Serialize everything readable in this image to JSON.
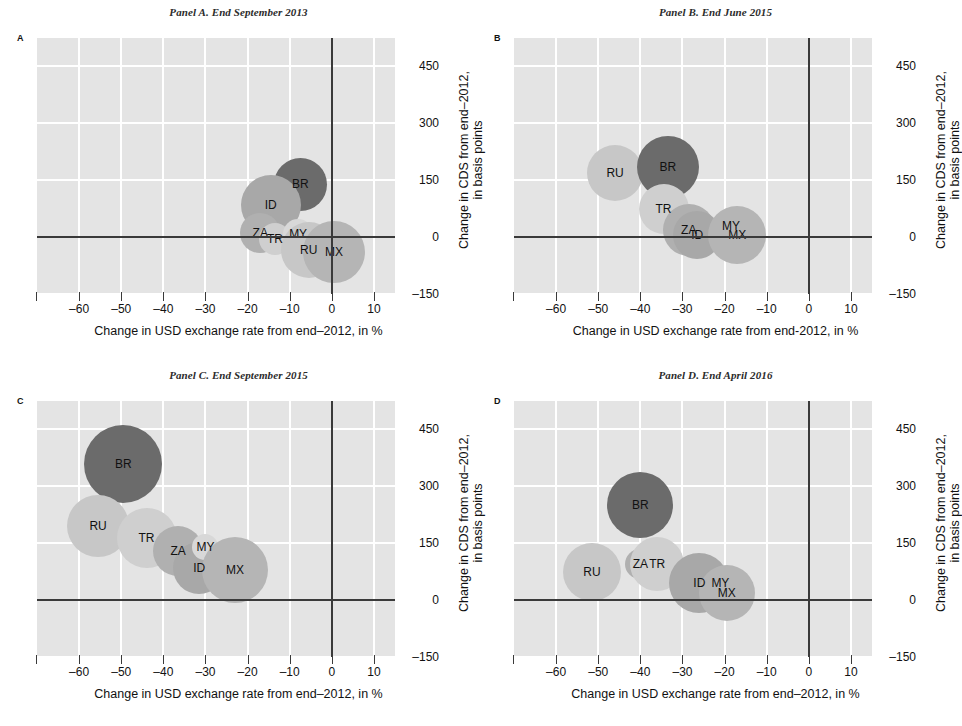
{
  "figure": {
    "width": 954,
    "height": 726,
    "background": "#ffffff",
    "plot_background": "#e4e4e4",
    "gridline_color": "#ffffff",
    "axis_color": "#3a3a3a"
  },
  "axes": {
    "xlabel": "Change in USD exchange rate from end–2012, in %",
    "xlabel_b": "Change in USD exchange rate from end-2012, in %",
    "ylabel_line1": "Change in CDS from end–2012,",
    "ylabel_line2": "in basis points",
    "xticks": [
      "–60",
      "–50",
      "–40",
      "–30",
      "–20",
      "–10",
      "0",
      "10"
    ],
    "xtick_values": [
      -60,
      -50,
      -40,
      -30,
      -20,
      -10,
      0,
      10
    ],
    "yticks": [
      "450",
      "300",
      "150",
      "0",
      "–150"
    ],
    "ytick_values": [
      450,
      300,
      150,
      0,
      -150
    ],
    "xlim": [
      -70,
      15
    ],
    "ylim": [
      -150,
      525
    ]
  },
  "series_colors": {
    "BR": "#6b6b6b",
    "RU": "#c7c7c7",
    "TR": "#cfcfcf",
    "ZA": "#b0b0b0",
    "ID": "#a8a8a8",
    "MY": "#d8d8d8",
    "MX": "#b5b5b5"
  },
  "panels": [
    {
      "id": "A",
      "letter": "A",
      "title": "Panel A. End September 2013",
      "xlabel": "Change in USD exchange rate from end–2012, in %"
    },
    {
      "id": "B",
      "letter": "B",
      "title": "Panel B. End June 2015",
      "xlabel": "Change in USD exchange rate from end-2012, in %"
    },
    {
      "id": "C",
      "letter": "C",
      "title": "Panel C. End September 2015",
      "xlabel": "Change in USD exchange rate from end–2012, in %"
    },
    {
      "id": "D",
      "letter": "D",
      "title": "Panel D. End April 2016",
      "xlabel": "Change in USD exchange rate from end–2012, in %"
    }
  ],
  "chart_data": [
    {
      "type": "scatter",
      "variant": "bubble",
      "panel": "A",
      "title": "Panel A. End September 2013",
      "xlabel": "Change in USD exchange rate from end–2012, in %",
      "ylabel": "Change in CDS from end–2012, in basis points",
      "xlim": [
        -70,
        15
      ],
      "ylim": [
        -150,
        525
      ],
      "grid": true,
      "legend": "none",
      "points": [
        {
          "label": "BR",
          "x": -7.5,
          "y": 140,
          "size": 53,
          "color": "#6b6b6b"
        },
        {
          "label": "ID",
          "x": -14.5,
          "y": 85,
          "size": 60,
          "color": "#a8a8a8"
        },
        {
          "label": "ZA",
          "x": -17.0,
          "y": 10,
          "size": 40,
          "color": "#b0b0b0"
        },
        {
          "label": "TR",
          "x": -13.5,
          "y": -5,
          "size": 32,
          "color": "#cfcfcf"
        },
        {
          "label": "MY",
          "x": -8.0,
          "y": 8,
          "size": 30,
          "color": "#d8d8d8"
        },
        {
          "label": "RU",
          "x": -5.5,
          "y": -35,
          "size": 56,
          "color": "#c7c7c7"
        },
        {
          "label": "MX",
          "x": 0.5,
          "y": -40,
          "size": 62,
          "color": "#b5b5b5"
        }
      ]
    },
    {
      "type": "scatter",
      "variant": "bubble",
      "panel": "B",
      "title": "Panel B. End June 2015",
      "xlabel": "Change in USD exchange rate from end-2012, in %",
      "ylabel": "Change in CDS from end–2012, in basis points",
      "xlim": [
        -70,
        15
      ],
      "ylim": [
        -150,
        525
      ],
      "grid": true,
      "legend": "none",
      "points": [
        {
          "label": "RU",
          "x": -46.0,
          "y": 170,
          "size": 56,
          "color": "#c7c7c7"
        },
        {
          "label": "BR",
          "x": -33.5,
          "y": 185,
          "size": 62,
          "color": "#6b6b6b"
        },
        {
          "label": "TR",
          "x": -34.5,
          "y": 75,
          "size": 50,
          "color": "#cfcfcf"
        },
        {
          "label": "ZA",
          "x": -28.5,
          "y": 20,
          "size": 52,
          "color": "#b0b0b0"
        },
        {
          "label": "ID",
          "x": -26.5,
          "y": 5,
          "size": 48,
          "color": "#a8a8a8"
        },
        {
          "label": "MY",
          "x": -18.5,
          "y": 28,
          "size": 24,
          "color": "#d8d8d8"
        },
        {
          "label": "MX",
          "x": -17.0,
          "y": 5,
          "size": 58,
          "color": "#b5b5b5"
        }
      ]
    },
    {
      "type": "scatter",
      "variant": "bubble",
      "panel": "C",
      "title": "Panel C. End September 2015",
      "xlabel": "Change in USD exchange rate from end–2012, in %",
      "ylabel": "Change in CDS from end–2012, in basis points",
      "xlim": [
        -70,
        15
      ],
      "ylim": [
        -150,
        525
      ],
      "grid": true,
      "legend": "none",
      "points": [
        {
          "label": "BR",
          "x": -49.5,
          "y": 360,
          "size": 78,
          "color": "#6b6b6b"
        },
        {
          "label": "RU",
          "x": -55.5,
          "y": 195,
          "size": 62,
          "color": "#c7c7c7"
        },
        {
          "label": "TR",
          "x": -44.0,
          "y": 165,
          "size": 60,
          "color": "#cfcfcf"
        },
        {
          "label": "ZA",
          "x": -36.5,
          "y": 130,
          "size": 50,
          "color": "#b0b0b0"
        },
        {
          "label": "ID",
          "x": -31.5,
          "y": 85,
          "size": 52,
          "color": "#a8a8a8"
        },
        {
          "label": "MY",
          "x": -30.0,
          "y": 140,
          "size": 26,
          "color": "#d8d8d8"
        },
        {
          "label": "MX",
          "x": -23.0,
          "y": 80,
          "size": 66,
          "color": "#b5b5b5"
        }
      ]
    },
    {
      "type": "scatter",
      "variant": "bubble",
      "panel": "D",
      "title": "Panel D. End April 2016",
      "xlabel": "Change in USD exchange rate from end–2012, in %",
      "ylabel": "Change in CDS from end–2012, in basis points",
      "xlim": [
        -70,
        15
      ],
      "ylim": [
        -150,
        525
      ],
      "grid": true,
      "legend": "none",
      "points": [
        {
          "label": "BR",
          "x": -40.0,
          "y": 250,
          "size": 66,
          "color": "#6b6b6b"
        },
        {
          "label": "RU",
          "x": -51.5,
          "y": 75,
          "size": 58,
          "color": "#c7c7c7"
        },
        {
          "label": "ZA",
          "x": -40.0,
          "y": 95,
          "size": 30,
          "color": "#b0b0b0"
        },
        {
          "label": "TR",
          "x": -36.0,
          "y": 95,
          "size": 54,
          "color": "#cfcfcf"
        },
        {
          "label": "ID",
          "x": -26.0,
          "y": 45,
          "size": 60,
          "color": "#a8a8a8"
        },
        {
          "label": "MY",
          "x": -21.0,
          "y": 45,
          "size": 26,
          "color": "#d8d8d8"
        },
        {
          "label": "MX",
          "x": -19.5,
          "y": 20,
          "size": 56,
          "color": "#b5b5b5"
        }
      ]
    }
  ]
}
